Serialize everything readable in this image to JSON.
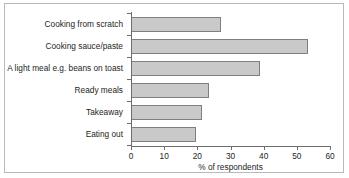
{
  "chart_data": {
    "type": "bar",
    "orientation": "horizontal",
    "title": "",
    "xlabel": "% of respondents",
    "ylabel": "",
    "xlim": [
      0,
      60
    ],
    "xticks": [
      "0",
      "10",
      "20",
      "30",
      "40",
      "50",
      "60"
    ],
    "grid": false,
    "legend": null,
    "categories": [
      "Cooking from scratch",
      "Cooking sauce/paste",
      "A light meal e.g. beans on toast",
      "Ready meals",
      "Takeaway",
      "Eating out"
    ],
    "values": [
      27,
      53.5,
      39,
      23.5,
      21.5,
      19.5
    ],
    "bar_fill_color": "#c9c9c9",
    "bar_border_color": "#7f7f7f",
    "frame_color": "#b9b9b9",
    "axis_color": "#6d6d6d",
    "text_color": "#231f20"
  }
}
